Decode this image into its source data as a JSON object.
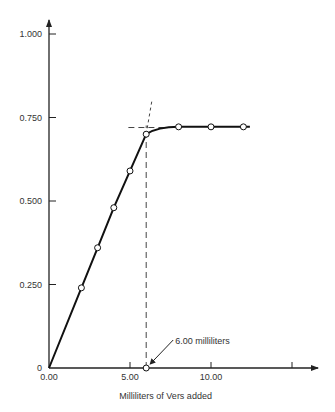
{
  "chart_data": {
    "type": "line",
    "title": "",
    "xlabel": "Milliliters of Vers added",
    "ylabel": "",
    "xlim": [
      0,
      15.5
    ],
    "ylim": [
      0,
      1.05
    ],
    "x_ticks": [
      0,
      5,
      10,
      15
    ],
    "x_tick_labels": [
      "0.00",
      "5.00",
      "10.00",
      ""
    ],
    "y_ticks": [
      0,
      0.25,
      0.5,
      0.75,
      1.0
    ],
    "y_tick_labels": [
      "0",
      "0.250",
      "0.500",
      "0.750",
      "1.000"
    ],
    "grid": false,
    "series": [
      {
        "name": "titration",
        "points": [
          {
            "x": 0,
            "y": 0,
            "marker": false
          },
          {
            "x": 2,
            "y": 0.24,
            "marker": true
          },
          {
            "x": 3,
            "y": 0.36,
            "marker": true
          },
          {
            "x": 4,
            "y": 0.48,
            "marker": true
          },
          {
            "x": 5,
            "y": 0.59,
            "marker": true
          },
          {
            "x": 6,
            "y": 0.7,
            "marker": true
          },
          {
            "x": 8,
            "y": 0.72,
            "marker": true
          },
          {
            "x": 10,
            "y": 0.72,
            "marker": true
          },
          {
            "x": 12,
            "y": 0.72,
            "marker": true
          },
          {
            "x": 12.4,
            "y": 0.72,
            "marker": false
          }
        ]
      }
    ],
    "endpoint": {
      "x": 6.0,
      "y": 0.72
    },
    "annotations": [
      {
        "text": "6.00 milliliters",
        "x": 6.0,
        "y": 0
      }
    ]
  }
}
